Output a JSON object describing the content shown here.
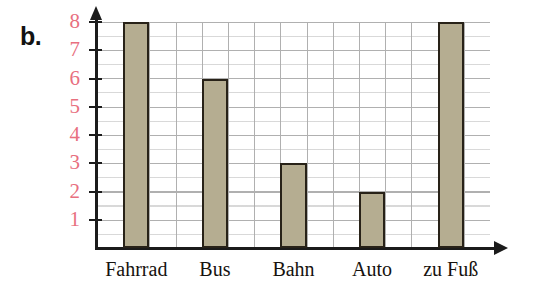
{
  "figure": {
    "part_label": "b.",
    "background_color": "#ffffff"
  },
  "chart_data": {
    "type": "bar",
    "title": "",
    "subtitle": "",
    "xlabel": "",
    "ylabel": "",
    "categories": [
      "Fahrrad",
      "Bus",
      "Bahn",
      "Auto",
      "zu Fuß"
    ],
    "values": [
      8,
      6,
      3,
      2,
      8
    ],
    "series": [
      {
        "name": "Anzahl",
        "values": [
          8,
          6,
          3,
          2,
          8
        ]
      }
    ],
    "ylim": [
      0,
      8
    ],
    "ytick_labels": [
      "1",
      "2",
      "3",
      "4",
      "5",
      "6",
      "7",
      "8"
    ],
    "ytick_values": [
      1,
      2,
      3,
      4,
      5,
      6,
      7,
      8
    ],
    "grid": true,
    "legend": false,
    "legend_position": "none",
    "annotations": [],
    "colors": {
      "bar_fill": "#b5ad91",
      "bar_border": "#282218",
      "axis": "#1b1b1b",
      "grid": "#b0b0b0",
      "ytick_label": "#e8707f",
      "xtick_label": "#16120e",
      "part_label": "#121212"
    }
  }
}
